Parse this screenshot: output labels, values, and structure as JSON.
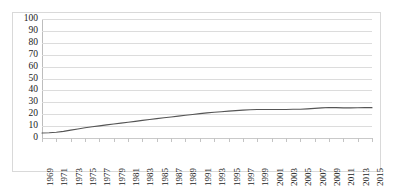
{
  "figure": {
    "name": "line-chart",
    "border_color": "#d9d9d9",
    "background": "#ffffff"
  },
  "chart_data": {
    "type": "line",
    "title": "",
    "subtitle": "",
    "xlabel": "",
    "ylabel": "",
    "xlim": [
      1969,
      2015
    ],
    "ylim": [
      0,
      100
    ],
    "grid": true,
    "legend": false,
    "legend_position": "none",
    "line_color": "#555555",
    "line_width": 1.2,
    "markers": false,
    "y_ticks": [
      0,
      10,
      20,
      30,
      40,
      50,
      60,
      70,
      80,
      90,
      100
    ],
    "y_tick_labels": [
      "0",
      "10",
      "20",
      "30",
      "40",
      "50",
      "60",
      "70",
      "80",
      "90",
      "100"
    ],
    "x_tick_labels": [
      "1969",
      "1971",
      "1973",
      "1975",
      "1977",
      "1979",
      "1981",
      "1983",
      "1985",
      "1987",
      "1989",
      "1991",
      "1993",
      "1995",
      "1997",
      "1999",
      "2001",
      "2003",
      "2005",
      "2007",
      "2009",
      "2011",
      "2013",
      "2015"
    ],
    "x": [
      1969,
      1970,
      1971,
      1972,
      1973,
      1974,
      1975,
      1976,
      1977,
      1978,
      1979,
      1980,
      1981,
      1982,
      1983,
      1984,
      1985,
      1986,
      1987,
      1988,
      1989,
      1990,
      1991,
      1992,
      1993,
      1994,
      1995,
      1996,
      1997,
      1998,
      1999,
      2000,
      2001,
      2002,
      2003,
      2004,
      2005,
      2006,
      2007,
      2008,
      2009,
      2010,
      2011,
      2012,
      2013,
      2014,
      2015
    ],
    "values": [
      4.2,
      4.4,
      4.8,
      5.6,
      6.6,
      7.6,
      8.6,
      9.4,
      10.2,
      11.0,
      11.8,
      12.5,
      13.2,
      14.0,
      14.8,
      15.6,
      16.3,
      17.0,
      17.7,
      18.4,
      19.1,
      19.8,
      20.5,
      21.1,
      21.6,
      22.1,
      22.6,
      23.0,
      23.4,
      23.7,
      23.9,
      24.0,
      24.0,
      24.0,
      24.0,
      24.1,
      24.2,
      24.5,
      24.9,
      25.3,
      25.6,
      25.5,
      25.3,
      25.3,
      25.4,
      25.5,
      25.5
    ],
    "series": [
      {
        "name": "series-1",
        "color": "#555555",
        "values": [
          4.2,
          4.4,
          4.8,
          5.6,
          6.6,
          7.6,
          8.6,
          9.4,
          10.2,
          11.0,
          11.8,
          12.5,
          13.2,
          14.0,
          14.8,
          15.6,
          16.3,
          17.0,
          17.7,
          18.4,
          19.1,
          19.8,
          20.5,
          21.1,
          21.6,
          22.1,
          22.6,
          23.0,
          23.4,
          23.7,
          23.9,
          24.0,
          24.0,
          24.0,
          24.0,
          24.1,
          24.2,
          24.5,
          24.9,
          25.3,
          25.6,
          25.5,
          25.3,
          25.3,
          25.4,
          25.5,
          25.5
        ]
      }
    ]
  }
}
